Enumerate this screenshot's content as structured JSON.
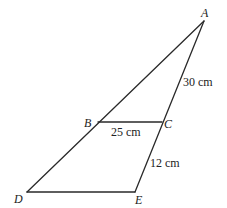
{
  "diagram": {
    "type": "geometry-triangle",
    "points": {
      "A": {
        "label": "A",
        "x": 204,
        "y": 21
      },
      "B": {
        "label": "B",
        "x": 98,
        "y": 122
      },
      "C": {
        "label": "C",
        "x": 162,
        "y": 122
      },
      "D": {
        "label": "D",
        "x": 27,
        "y": 192
      },
      "E": {
        "label": "E",
        "x": 135,
        "y": 192
      }
    },
    "segments": [
      {
        "from": "A",
        "to": "D"
      },
      {
        "from": "A",
        "to": "E"
      },
      {
        "from": "B",
        "to": "C"
      },
      {
        "from": "D",
        "to": "E"
      }
    ],
    "measurements": {
      "AC": "30 cm",
      "BC": "25 cm",
      "CE": "12 cm"
    }
  }
}
